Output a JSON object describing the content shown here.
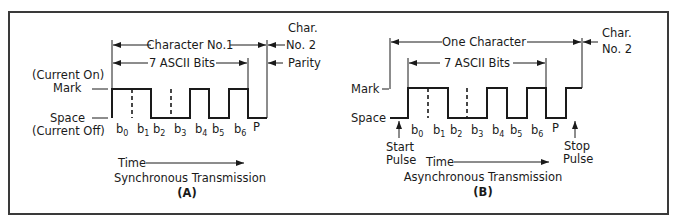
{
  "figure": {
    "panel_a": {
      "caption_title": "Synchronous Transmission",
      "caption_letter": "(A)",
      "mark_label": "Mark",
      "mark_sub": "(Current On)",
      "space_label": "Space",
      "space_sub": "(Current Off)",
      "span_character": "Character No.1",
      "span_bits": "7 ASCII Bits",
      "next_char_line1": "Char.",
      "next_char_line2": "No. 2",
      "parity_label": "Parity",
      "time_label": "Time",
      "bits": [
        "b",
        "b",
        "b",
        "b",
        "b",
        "b",
        "b",
        "P"
      ],
      "bit_subs": [
        "0",
        "1",
        "2",
        "3",
        "4",
        "5",
        "6",
        ""
      ]
    },
    "panel_b": {
      "caption_title": "Asynchronous Transmission",
      "caption_letter": "(B)",
      "mark_label": "Mark",
      "space_label": "Space",
      "span_character": "One Character",
      "span_bits": "7 ASCII Bits",
      "next_char_line1": "Char.",
      "next_char_line2": "No. 2",
      "start_line1": "Start",
      "start_line2": "Pulse",
      "stop_line1": "Stop",
      "stop_line2": "Pulse",
      "time_label": "Time",
      "bits": [
        "b",
        "b",
        "b",
        "b",
        "b",
        "b",
        "b",
        "P"
      ],
      "bit_subs": [
        "0",
        "1",
        "2",
        "3",
        "4",
        "5",
        "6",
        ""
      ]
    }
  }
}
